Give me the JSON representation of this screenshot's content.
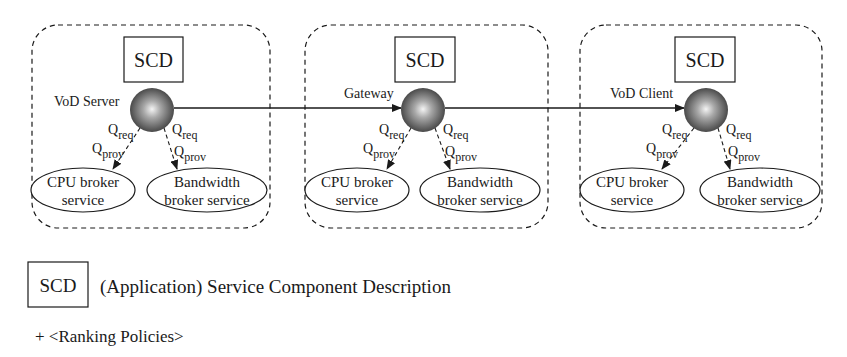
{
  "diagram": {
    "nodes": [
      {
        "id": "vod-server",
        "label": "VoD Server",
        "scd_label": "SCD",
        "frame": {
          "x": 32,
          "y": 25,
          "w": 238,
          "h": 203
        },
        "scd_box": {
          "x": 124,
          "y": 37,
          "w": 59,
          "h": 45
        },
        "sphere": {
          "cx": 152,
          "cy": 110,
          "r": 22
        },
        "label_pos": {
          "x": 54,
          "y": 106
        },
        "services": [
          {
            "name": "CPU broker service",
            "line1": "CPU broker",
            "line2": "service",
            "cx": 83,
            "cy": 190,
            "rx": 52,
            "ry": 22
          },
          {
            "name": "Bandwidth broker service",
            "line1": "Bandwidth",
            "line2": "broker service",
            "cx": 207,
            "cy": 190,
            "rx": 60,
            "ry": 22
          }
        ],
        "q_labels": {
          "req": "req",
          "prov": "prov",
          "Q": "Q"
        }
      },
      {
        "id": "gateway",
        "label": "Gateway",
        "scd_label": "SCD",
        "frame": {
          "x": 305,
          "y": 25,
          "w": 243,
          "h": 203
        },
        "scd_box": {
          "x": 395,
          "y": 37,
          "w": 60,
          "h": 45
        },
        "sphere": {
          "cx": 423,
          "cy": 110,
          "r": 22
        },
        "label_pos": {
          "x": 344,
          "y": 98
        },
        "services": [
          {
            "name": "CPU broker service",
            "line1": "CPU broker",
            "line2": "service",
            "cx": 357,
            "cy": 190,
            "rx": 52,
            "ry": 22
          },
          {
            "name": "Bandwidth broker service",
            "line1": "Bandwidth",
            "line2": "broker service",
            "cx": 480,
            "cy": 190,
            "rx": 60,
            "ry": 22
          }
        ],
        "q_labels": {
          "req": "req",
          "prov": "prov",
          "Q": "Q"
        }
      },
      {
        "id": "vod-client",
        "label": "VoD Client",
        "scd_label": "SCD",
        "frame": {
          "x": 580,
          "y": 25,
          "w": 242,
          "h": 203
        },
        "scd_box": {
          "x": 675,
          "y": 37,
          "w": 60,
          "h": 45
        },
        "sphere": {
          "cx": 706,
          "cy": 110,
          "r": 22
        },
        "label_pos": {
          "x": 610,
          "y": 98
        },
        "services": [
          {
            "name": "CPU broker service",
            "line1": "CPU broker",
            "line2": "service",
            "cx": 632,
            "cy": 190,
            "rx": 52,
            "ry": 22
          },
          {
            "name": "Bandwidth broker service",
            "line1": "Bandwidth",
            "line2": "broker service",
            "cx": 760,
            "cy": 190,
            "rx": 60,
            "ry": 22
          }
        ],
        "q_labels": {
          "req": "req",
          "prov": "prov",
          "Q": "Q"
        }
      }
    ],
    "connections": [
      {
        "from": "vod-server",
        "to": "gateway"
      },
      {
        "from": "gateway",
        "to": "vod-client"
      }
    ]
  },
  "legend": {
    "scd_label": "SCD",
    "description": "(Application) Service Component Description",
    "ranking": "+ <Ranking Policies>"
  },
  "colors": {
    "stroke": "#1a1a1a",
    "sphere_light": "#f2f2f2",
    "sphere_dark": "#3a3a3a"
  }
}
